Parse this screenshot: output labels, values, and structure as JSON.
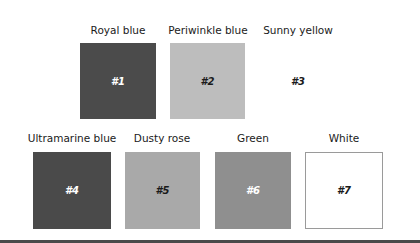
{
  "swatches": [
    {
      "id": "#1",
      "name": "Royal blue",
      "color": "#4b4b4b",
      "text_color": "#ffffff"
    },
    {
      "id": "#2",
      "name": "Periwinkle blue",
      "color": "#bdbdbd",
      "text_color": "#1a1a1a"
    },
    {
      "id": "#3",
      "name": "Sunny yellow",
      "color": "#ffffff",
      "text_color": "#1a1a1a"
    },
    {
      "id": "#4",
      "name": "Ultramarine blue",
      "color": "#4a4a4a",
      "text_color": "#ffffff"
    },
    {
      "id": "#5",
      "name": "Dusty rose",
      "color": "#a9a9a9",
      "text_color": "#1a1a1a"
    },
    {
      "id": "#6",
      "name": "Green",
      "color": "#8f8f8f",
      "text_color": "#ffffff"
    },
    {
      "id": "#7",
      "name": "White",
      "color": "#ffffff",
      "text_color": "#1a1a1a"
    }
  ]
}
